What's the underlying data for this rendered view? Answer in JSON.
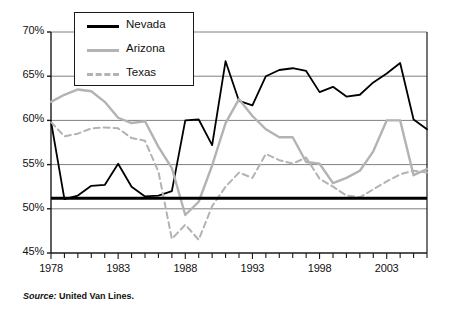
{
  "source": {
    "key": "Source:",
    "value": "United Van Lines."
  },
  "legend": {
    "position": "top-left-inside",
    "items": [
      {
        "label": "Nevada",
        "color": "#000000",
        "style": "solid",
        "name": "legend-item-nevada"
      },
      {
        "label": "Arizona",
        "color": "#b3b3b3",
        "style": "solid",
        "name": "legend-item-arizona"
      },
      {
        "label": "Texas",
        "color": "#b3b3b3",
        "style": "dashed",
        "name": "legend-item-texas"
      }
    ]
  },
  "chart_data": {
    "type": "line",
    "title": "",
    "subtitle": "",
    "xlabel": "",
    "ylabel": "",
    "xlim": [
      1978,
      2006
    ],
    "ylim": [
      45,
      70
    ],
    "ytick_values": [
      45,
      50,
      55,
      60,
      65,
      70
    ],
    "ytick_labels": [
      "45%",
      "50%",
      "55%",
      "60%",
      "65%",
      "70%"
    ],
    "xtick_values": [
      1978,
      1983,
      1988,
      1993,
      1998,
      2003
    ],
    "xtick_labels": [
      "1978",
      "1983",
      "1988",
      "1993",
      "1998",
      "2003"
    ],
    "minor_xticks": "annual",
    "grid": "horizontal",
    "grid_color": "#808080",
    "reference_line": {
      "value": 51.2,
      "color": "#000000",
      "width": 3,
      "label": ""
    },
    "x": [
      1978,
      1979,
      1980,
      1981,
      1982,
      1983,
      1984,
      1985,
      1986,
      1987,
      1988,
      1989,
      1990,
      1991,
      1992,
      1993,
      1994,
      1995,
      1996,
      1997,
      1998,
      1999,
      2000,
      2001,
      2002,
      2003,
      2004,
      2005,
      2006
    ],
    "series": [
      {
        "name": "Nevada",
        "color": "#000000",
        "style": "solid",
        "values": [
          59.9,
          51.1,
          51.5,
          52.6,
          52.7,
          55.1,
          52.5,
          51.4,
          51.5,
          52.0,
          60.0,
          60.1,
          57.2,
          66.7,
          62.2,
          61.7,
          65.0,
          65.7,
          65.9,
          65.6,
          63.2,
          63.8,
          62.7,
          62.9,
          64.3,
          65.3,
          66.5,
          60.1,
          59.0
        ]
      },
      {
        "name": "Arizona",
        "color": "#b3b3b3",
        "style": "solid",
        "values": [
          62.1,
          62.9,
          63.5,
          63.3,
          62.1,
          60.3,
          59.7,
          59.9,
          57.0,
          54.6,
          49.3,
          50.8,
          54.9,
          59.7,
          62.4,
          60.5,
          59.0,
          58.1,
          58.1,
          55.3,
          55.1,
          52.9,
          53.5,
          54.3,
          56.5,
          60.0,
          60.0,
          53.8,
          54.5
        ]
      },
      {
        "name": "Texas",
        "color": "#b3b3b3",
        "style": "dashed",
        "values": [
          59.8,
          58.2,
          58.5,
          59.1,
          59.2,
          59.1,
          58.0,
          57.7,
          54.2,
          46.6,
          48.2,
          46.5,
          50.3,
          52.5,
          54.1,
          53.5,
          56.2,
          55.5,
          55.1,
          55.8,
          53.4,
          52.5,
          51.5,
          51.3,
          52.2,
          53.1,
          53.9,
          54.3,
          54.1
        ]
      }
    ]
  }
}
